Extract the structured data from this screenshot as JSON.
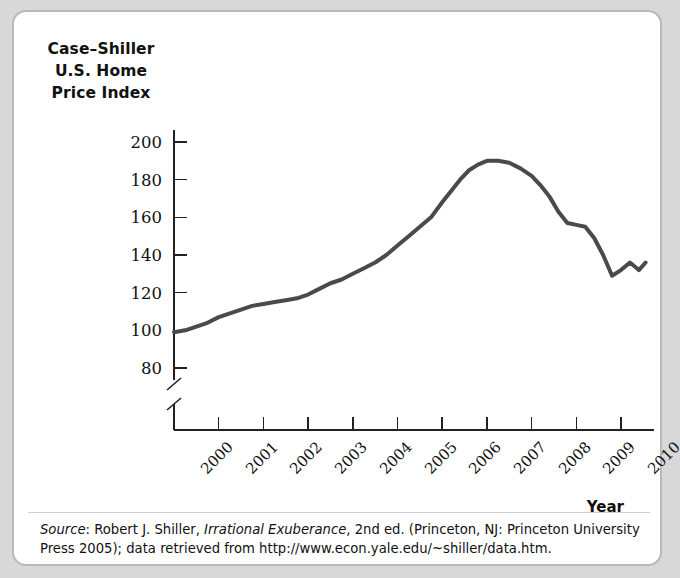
{
  "figure": {
    "y_axis_title_lines": [
      "Case–Shiller",
      "U.S. Home",
      "Price Index"
    ],
    "x_axis_title": "Year",
    "source_prefix": "Source",
    "source_sep": ": Robert J. Shiller, ",
    "source_book": "Irrational Exuberance",
    "source_rest": ", 2nd ed. (Princeton, NJ: Princeton University Press 2005); data retrieved from http://www.econ.yale.edu/~shiller/data.htm."
  },
  "chart_data": {
    "type": "line",
    "title": "Case–Shiller U.S. Home Price Index",
    "xlabel": "Year",
    "ylabel": "Case–Shiller U.S. Home Price Index",
    "ylim": [
      80,
      200
    ],
    "yticks": [
      80,
      100,
      120,
      140,
      160,
      180,
      200
    ],
    "ytick_labels": [
      "80",
      "100",
      "120",
      "140",
      "160",
      "180",
      "200"
    ],
    "axis_break": true,
    "xlim": [
      2000,
      2010.6
    ],
    "xticks": [
      2000,
      2001,
      2002,
      2003,
      2004,
      2005,
      2006,
      2007,
      2008,
      2009,
      2010
    ],
    "xtick_labels": [
      "2000",
      "2001",
      "2002",
      "2003",
      "2004",
      "2005",
      "2006",
      "2007",
      "2008",
      "2009",
      "2010"
    ],
    "grid": false,
    "legend": null,
    "line_color": "#4a4a4a",
    "line_width": 4,
    "series": [
      {
        "name": "Case–Shiller U.S. Home Price Index",
        "x": [
          2000.0,
          2000.25,
          2000.5,
          2000.75,
          2001.0,
          2001.25,
          2001.5,
          2001.75,
          2002.0,
          2002.25,
          2002.5,
          2002.75,
          2003.0,
          2003.25,
          2003.5,
          2003.75,
          2004.0,
          2004.25,
          2004.5,
          2004.75,
          2005.0,
          2005.25,
          2005.5,
          2005.75,
          2006.0,
          2006.2,
          2006.4,
          2006.6,
          2006.8,
          2007.0,
          2007.25,
          2007.5,
          2007.75,
          2008.0,
          2008.2,
          2008.4,
          2008.6,
          2008.8,
          2009.0,
          2009.2,
          2009.4,
          2009.6,
          2009.8,
          2010.0,
          2010.2,
          2010.4,
          2010.55
        ],
        "y": [
          99,
          100,
          102,
          104,
          107,
          109,
          111,
          113,
          114,
          115,
          116,
          117,
          119,
          122,
          125,
          127,
          130,
          133,
          136,
          140,
          145,
          150,
          155,
          160,
          168,
          174,
          180,
          185,
          188,
          190,
          190,
          189,
          186,
          182,
          177,
          171,
          163,
          157,
          156,
          155,
          149,
          140,
          129,
          132,
          136,
          132,
          136
        ]
      }
    ],
    "annotations": []
  }
}
